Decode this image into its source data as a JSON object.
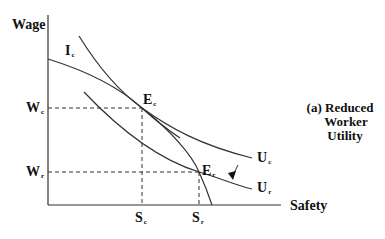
{
  "diagram": {
    "title": "(a) Reduced Worker Utility",
    "caption_lines": [
      "(a) Reduced",
      "Worker",
      "Utility"
    ],
    "axes": {
      "y_label": "Wage",
      "x_label": "Safety"
    },
    "y_ticks": [
      {
        "main": "W",
        "sub": "c"
      },
      {
        "main": "W",
        "sub": "r"
      }
    ],
    "x_ticks": [
      {
        "main": "S",
        "sub": "c"
      },
      {
        "main": "S",
        "sub": "r"
      }
    ],
    "curves": [
      {
        "main": "I",
        "sub": "c",
        "kind": "isoprofit"
      },
      {
        "main": "U",
        "sub": "c",
        "kind": "indifference"
      },
      {
        "main": "U",
        "sub": "r",
        "kind": "indifference"
      }
    ],
    "points": [
      {
        "main": "E",
        "sub": "c"
      },
      {
        "main": "E",
        "sub": "r"
      }
    ],
    "colors": {
      "line": "#333333",
      "text": "#111111"
    }
  }
}
